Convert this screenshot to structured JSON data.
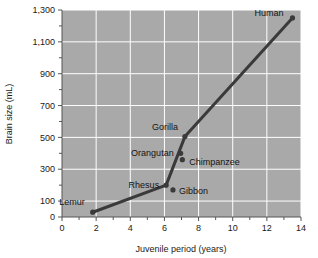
{
  "chart_data": {
    "type": "line",
    "title": "",
    "xlabel": "Juvenile period (years)",
    "ylabel": "Brain size (mL)",
    "xlim": [
      0,
      14
    ],
    "ylim": [
      0,
      1300
    ],
    "grid": true,
    "legend": "none",
    "plot_background_color": "#a9a9a9",
    "gridline_color": "#ffffff",
    "line_color": "#3a3a3a",
    "marker_color": "#3a3a3a",
    "x_ticks_major": [
      0,
      2,
      4,
      6,
      8,
      10,
      12,
      14
    ],
    "x_tick_labels": [
      "0",
      "2",
      "4",
      "6",
      "8",
      "10",
      "12",
      "14"
    ],
    "x_ticks_minor": [
      1,
      3,
      5,
      7,
      9,
      11,
      13
    ],
    "y_ticks_major": [
      0,
      100,
      300,
      500,
      700,
      900,
      1100,
      1300
    ],
    "y_tick_labels": [
      "0",
      "100",
      "300",
      "500",
      "700",
      "900",
      "1,100",
      "1,300"
    ],
    "y_ticks_minor": [
      200,
      400,
      600,
      800,
      1000,
      1200
    ],
    "series": [
      {
        "name": "Primate brain size vs juvenile period",
        "points": [
          {
            "label": "Lemur",
            "x": 1.8,
            "y": 30,
            "label_dx": -8,
            "label_dy": -7,
            "label_anchor": "end"
          },
          {
            "label": "Rhesus",
            "x": 6.1,
            "y": 200,
            "label_dx": -7,
            "label_dy": 3,
            "label_anchor": "end"
          },
          {
            "label": "Gibbon",
            "x": 6.5,
            "y": 170,
            "label_dx": 6,
            "label_dy": 4,
            "label_anchor": "start"
          },
          {
            "label": "Orangutan",
            "x": 6.95,
            "y": 400,
            "label_dx": -7,
            "label_dy": 3,
            "label_anchor": "end"
          },
          {
            "label": "Chimpanzee",
            "x": 7.05,
            "y": 360,
            "label_dx": 7,
            "label_dy": 5,
            "label_anchor": "start"
          },
          {
            "label": "Gorilla",
            "x": 7.2,
            "y": 505,
            "label_dx": -7,
            "label_dy": -7,
            "label_anchor": "end"
          },
          {
            "label": "Human",
            "x": 13.5,
            "y": 1250,
            "label_dx": -9,
            "label_dy": -2,
            "label_anchor": "end"
          }
        ],
        "path_order": [
          "Lemur",
          "Rhesus",
          "Gorilla",
          "Human"
        ]
      }
    ]
  }
}
